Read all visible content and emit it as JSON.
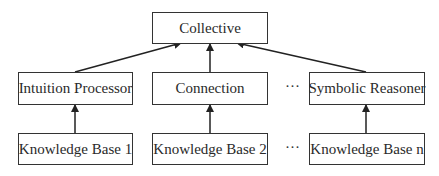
{
  "diagram": {
    "top": {
      "label": "Collective"
    },
    "middle": [
      {
        "label": "Intuition Processor"
      },
      {
        "label": "Connection"
      },
      {
        "label": "Symbolic Reasoner"
      }
    ],
    "bottom": [
      {
        "label": "Knowledge Base 1"
      },
      {
        "label": "Knowledge Base 2"
      },
      {
        "label": "Knowledge Base n"
      }
    ],
    "ellipsis": "···",
    "edges": [
      {
        "from": "Knowledge Base 1",
        "to": "Intuition Processor"
      },
      {
        "from": "Knowledge Base 2",
        "to": "Connection"
      },
      {
        "from": "Knowledge Base n",
        "to": "Symbolic Reasoner"
      },
      {
        "from": "Intuition Processor",
        "to": "Collective"
      },
      {
        "from": "Connection",
        "to": "Collective"
      },
      {
        "from": "Symbolic Reasoner",
        "to": "Collective"
      }
    ]
  }
}
